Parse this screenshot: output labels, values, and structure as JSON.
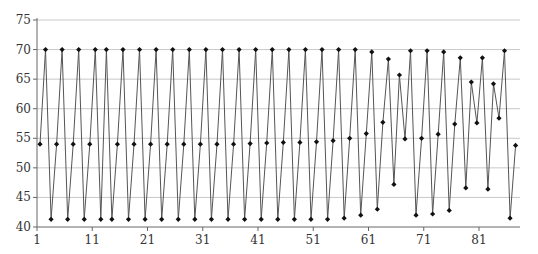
{
  "chart_data": {
    "type": "line",
    "title": "",
    "xlabel": "",
    "ylabel": "",
    "ylim": [
      40,
      75
    ],
    "yticks": [
      40,
      45,
      50,
      55,
      60,
      65,
      70,
      75
    ],
    "xticks": [
      1,
      11,
      21,
      31,
      41,
      51,
      61,
      71,
      81
    ],
    "grid": true,
    "legend": null,
    "colors": {
      "line": "#555555",
      "marker": "#111111",
      "grid": "#c8c8c8",
      "axis": "#666666"
    },
    "x": [
      1,
      2,
      3,
      4,
      5,
      6,
      7,
      8,
      9,
      10,
      11,
      12,
      13,
      14,
      15,
      16,
      17,
      18,
      19,
      20,
      21,
      22,
      23,
      24,
      25,
      26,
      27,
      28,
      29,
      30,
      31,
      32,
      33,
      34,
      35,
      36,
      37,
      38,
      39,
      40,
      41,
      42,
      43,
      44,
      45,
      46,
      47,
      48,
      49,
      50,
      51,
      52,
      53,
      54,
      55,
      56,
      57,
      58,
      59,
      60,
      61,
      62,
      63,
      64,
      65,
      66,
      67,
      68,
      69,
      70,
      71,
      72,
      73,
      74,
      75,
      76,
      77,
      78,
      79,
      80,
      81,
      82,
      83,
      84,
      85,
      86,
      87
    ],
    "series": [
      {
        "name": "series-1",
        "values": [
          54,
          70,
          41.3,
          54,
          70,
          41.3,
          54,
          70,
          41.3,
          54,
          70,
          41.3,
          70,
          41.3,
          54,
          70,
          41.3,
          54,
          70,
          41.3,
          54,
          70,
          41.3,
          54,
          70,
          41.3,
          54,
          70,
          41.3,
          54,
          70,
          41.3,
          54,
          70,
          41.3,
          54,
          70,
          41.3,
          54.1,
          70,
          41.3,
          54.2,
          70,
          41.3,
          54.3,
          70,
          41.3,
          54.3,
          70,
          41.3,
          54.4,
          70,
          41.3,
          54.6,
          70,
          41.5,
          55,
          70,
          42,
          55.8,
          69.6,
          43,
          57.7,
          68.4,
          47.2,
          65.7,
          54.9,
          69.8,
          42,
          55,
          69.8,
          42.2,
          55.7,
          69.6,
          42.8,
          57.4,
          68.6,
          46.6,
          64.5,
          57.6,
          68.6,
          46.4,
          64.2,
          58.4,
          69.8,
          41.5,
          53.8
        ]
      }
    ]
  }
}
